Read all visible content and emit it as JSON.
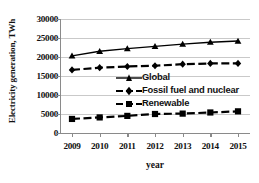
{
  "chart_data": {
    "type": "line",
    "title": "",
    "xlabel": "year",
    "ylabel": "Electricity generation, TWh",
    "categories": [
      "2009",
      "2010",
      "2011",
      "2012",
      "2013",
      "2014",
      "2015"
    ],
    "x": [
      2009,
      2010,
      2011,
      2012,
      2013,
      2014,
      2015
    ],
    "ylim": [
      0,
      30000
    ],
    "yticks": [
      "0",
      "5000",
      "10000",
      "15000",
      "20000",
      "25000",
      "30000"
    ],
    "ytick_values": [
      0,
      5000,
      10000,
      15000,
      20000,
      25000,
      30000
    ],
    "grid": true,
    "legend_position": "center-left-inside",
    "series": [
      {
        "name": "Global",
        "marker": "triangle",
        "line_style": "solid",
        "color": "#000000",
        "values": [
          20300,
          21500,
          22200,
          22800,
          23400,
          23900,
          24200
        ]
      },
      {
        "name": "Fossil fuel and nuclear",
        "marker": "diamond",
        "line_style": "dashed",
        "color": "#000000",
        "values": [
          16600,
          17200,
          17500,
          17700,
          18100,
          18300,
          18300
        ]
      },
      {
        "name": "Renewable",
        "marker": "square",
        "line_style": "dashed",
        "color": "#000000",
        "values": [
          3700,
          4100,
          4500,
          5000,
          5100,
          5400,
          5700
        ]
      }
    ]
  },
  "style": {
    "grid_color": "#c9c9c9",
    "axis_color": "#8a8a8a",
    "text_color": "#111111",
    "background": "#ffffff"
  }
}
